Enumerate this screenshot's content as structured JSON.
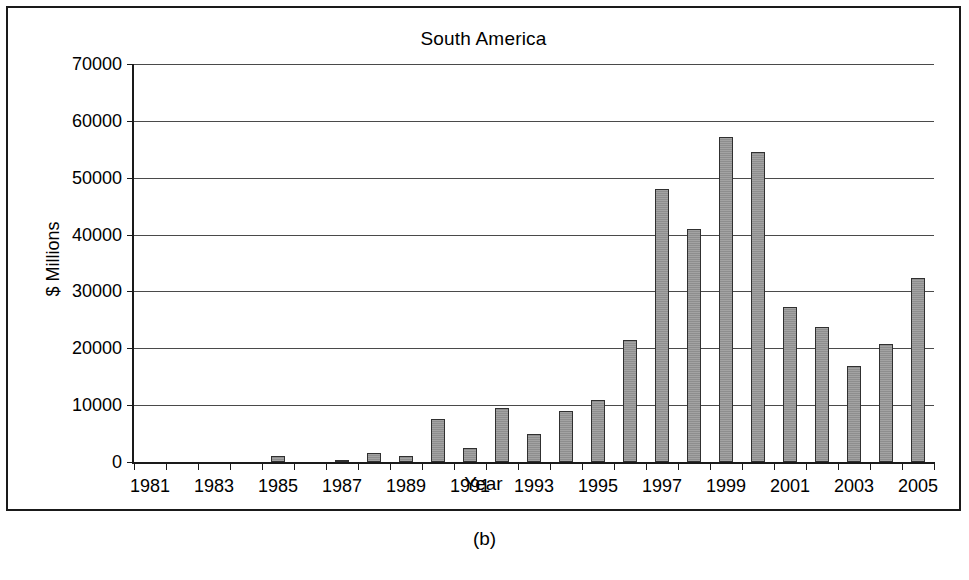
{
  "figure": {
    "caption": "(b)",
    "y_axis_title": "$ Millions",
    "x_axis_title": "Year"
  },
  "chart_data": {
    "type": "bar",
    "title": "South America",
    "xlabel": "Year",
    "ylabel": "$ Millions",
    "ylim": [
      0,
      70000
    ],
    "ytick_labels": [
      "0",
      "10000",
      "20000",
      "30000",
      "40000",
      "50000",
      "60000",
      "70000"
    ],
    "yticks": [
      0,
      10000,
      20000,
      30000,
      40000,
      50000,
      60000,
      70000
    ],
    "xtick_labels": [
      "1981",
      "1983",
      "1985",
      "1987",
      "1989",
      "1991",
      "1993",
      "1995",
      "1997",
      "1999",
      "2001",
      "2003",
      "2005"
    ],
    "grid": true,
    "legend": "none",
    "bar_color": "#999999",
    "bar_edge_color": "#303030",
    "categories": [
      "1981",
      "1982",
      "1983",
      "1984",
      "1985",
      "1986",
      "1987",
      "1988",
      "1989",
      "1990",
      "1991",
      "1992",
      "1993",
      "1994",
      "1995",
      "1996",
      "1997",
      "1998",
      "1999",
      "2000",
      "2001",
      "2002",
      "2003",
      "2004",
      "2005"
    ],
    "values": [
      0,
      0,
      0,
      0,
      1100,
      0,
      400,
      1500,
      1000,
      7600,
      2500,
      9500,
      5000,
      8900,
      10900,
      21400,
      48100,
      41000,
      57100,
      54500,
      27300,
      23700,
      16800,
      20800,
      32300
    ]
  }
}
